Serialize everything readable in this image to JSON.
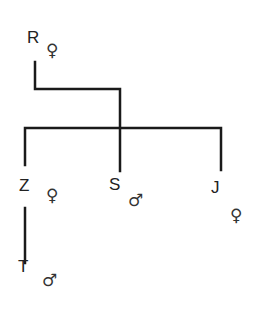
{
  "diagram": {
    "type": "family-tree",
    "members": [
      {
        "id": "R",
        "name": "R",
        "sex": "female",
        "symbol": "♀"
      },
      {
        "id": "Z",
        "name": "Z",
        "sex": "female",
        "symbol": "♀"
      },
      {
        "id": "S",
        "name": "S",
        "sex": "male",
        "symbol": "♂"
      },
      {
        "id": "J",
        "name": "J",
        "sex": "female",
        "symbol": "♀"
      },
      {
        "id": "T",
        "name": "T",
        "sex": "male",
        "symbol": "♂"
      }
    ],
    "edges": [
      {
        "from": "R",
        "to": "Z"
      },
      {
        "from": "R",
        "to": "S"
      },
      {
        "from": "R",
        "to": "J"
      },
      {
        "from": "Z",
        "to": "T"
      }
    ]
  }
}
